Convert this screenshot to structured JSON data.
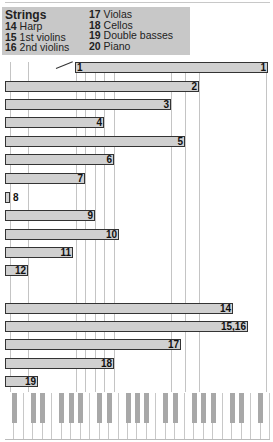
{
  "legend": {
    "title": "Strings",
    "items": [
      {
        "num": "14",
        "label": "Harp"
      },
      {
        "num": "15",
        "label": "1st violins"
      },
      {
        "num": "16",
        "label": "2nd violins"
      },
      {
        "num": "17",
        "label": "Violas"
      },
      {
        "num": "18",
        "label": "Cellos"
      },
      {
        "num": "19",
        "label": "Double basses"
      },
      {
        "num": "20",
        "label": "Piano"
      }
    ]
  },
  "chart_data": {
    "type": "bar",
    "orientation": "horizontal",
    "title": "Strings",
    "xlabel": "Pitch range (piano keyboard)",
    "ylabel": "",
    "x_unit": "px from left edge of keyboard",
    "bars": [
      {
        "label": "1",
        "start": 75,
        "end": 268
      },
      {
        "label": "2",
        "start": 5,
        "end": 199
      },
      {
        "label": "3",
        "start": 5,
        "end": 171
      },
      {
        "label": "4",
        "start": 5,
        "end": 104
      },
      {
        "label": "5",
        "start": 5,
        "end": 185
      },
      {
        "label": "6",
        "start": 5,
        "end": 114
      },
      {
        "label": "7",
        "start": 5,
        "end": 85
      },
      {
        "label": "8",
        "start": 5,
        "end": 10
      },
      {
        "label": "9",
        "start": 5,
        "end": 95
      },
      {
        "label": "10",
        "start": 5,
        "end": 119
      },
      {
        "label": "11",
        "start": 5,
        "end": 73
      },
      {
        "label": "12",
        "start": 5,
        "end": 28
      },
      {
        "label": "14",
        "start": 5,
        "end": 233
      },
      {
        "label": "15,16",
        "start": 5,
        "end": 248
      },
      {
        "label": "17",
        "start": 5,
        "end": 181
      },
      {
        "label": "18",
        "start": 5,
        "end": 114
      },
      {
        "label": "19",
        "start": 5,
        "end": 38
      }
    ],
    "gridlines_x": [
      10,
      28,
      76,
      85,
      95,
      104,
      114,
      171,
      185,
      199,
      266
    ],
    "grid": true,
    "legend_position": "top-left"
  },
  "bars_view": [
    {
      "label": "1",
      "left": 75,
      "width": 193,
      "top": 62,
      "leftlabel": "1"
    },
    {
      "label": "2",
      "left": 5,
      "width": 194,
      "top": 81
    },
    {
      "label": "3",
      "left": 5,
      "width": 166,
      "top": 99
    },
    {
      "label": "4",
      "left": 5,
      "width": 99,
      "top": 117
    },
    {
      "label": "5",
      "left": 5,
      "width": 180,
      "top": 136
    },
    {
      "label": "6",
      "left": 5,
      "width": 109,
      "top": 154
    },
    {
      "label": "7",
      "left": 5,
      "width": 80,
      "top": 173
    },
    {
      "label": "8",
      "left": 5,
      "width": 5,
      "top": 192,
      "outside": true
    },
    {
      "label": "9",
      "left": 5,
      "width": 90,
      "top": 210
    },
    {
      "label": "10",
      "left": 5,
      "width": 114,
      "top": 229
    },
    {
      "label": "11",
      "left": 5,
      "width": 68,
      "top": 247
    },
    {
      "label": "12",
      "left": 5,
      "width": 23,
      "top": 265
    },
    {
      "label": "14",
      "left": 5,
      "width": 228,
      "top": 303
    },
    {
      "label": "15,16",
      "left": 5,
      "width": 243,
      "top": 321
    },
    {
      "label": "17",
      "left": 5,
      "width": 176,
      "top": 339
    },
    {
      "label": "18",
      "left": 5,
      "width": 109,
      "top": 358
    },
    {
      "label": "19",
      "left": 5,
      "width": 33,
      "top": 376
    }
  ]
}
